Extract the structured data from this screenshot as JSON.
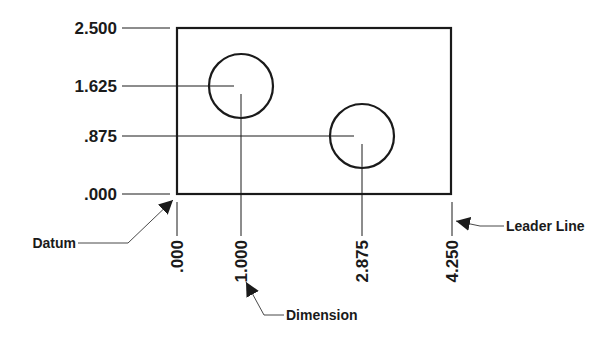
{
  "diagram": {
    "type": "baseline-dimensioning",
    "y_dimensions": [
      {
        "label": "2.500",
        "y": 28
      },
      {
        "label": "1.625",
        "y": 86
      },
      {
        "label": ".875",
        "y": 136
      },
      {
        "label": ".000",
        "y": 194
      }
    ],
    "x_dimensions": [
      {
        "label": ".000",
        "x": 177
      },
      {
        "label": "1.000",
        "x": 241
      },
      {
        "label": "2.875",
        "x": 362
      },
      {
        "label": "4.250",
        "x": 452
      }
    ],
    "callouts": {
      "datum": "Datum",
      "dimension": "Dimension",
      "leader_line": "Leader Line"
    },
    "colors": {
      "line": "#1a1a1a",
      "background": "#ffffff"
    }
  }
}
